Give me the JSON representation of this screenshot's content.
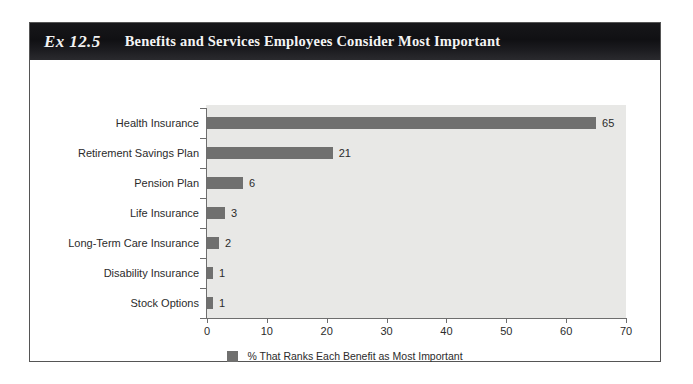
{
  "exhibit": {
    "number": "Ex 12.5",
    "title": "Benefits and Services Employees Consider Most Important"
  },
  "chart_data": {
    "type": "bar",
    "orientation": "horizontal",
    "title": "Benefits and Services Employees Consider Most Important",
    "categories": [
      "Health Insurance",
      "Retirement Savings Plan",
      "Pension Plan",
      "Life Insurance",
      "Long-Term Care Insurance",
      "Disability Insurance",
      "Stock Options"
    ],
    "values": [
      65,
      21,
      6,
      3,
      2,
      1,
      1
    ],
    "value_labels": [
      "65",
      "21",
      "6",
      "3",
      "2",
      "1",
      "1"
    ],
    "xlabel": "",
    "ylabel": "",
    "xlim": [
      0,
      70
    ],
    "xticks": [
      0,
      10,
      20,
      30,
      40,
      50,
      60,
      70
    ],
    "xtick_labels": [
      "0",
      "10",
      "20",
      "30",
      "40",
      "50",
      "60",
      "70"
    ],
    "grid": false,
    "legend": {
      "position": "bottom",
      "entries": [
        {
          "label": "% That Ranks Each Benefit as Most Important",
          "color": "#70706f"
        }
      ]
    },
    "series": [
      {
        "name": "% That Ranks Each Benefit as Most Important",
        "color": "#70706f",
        "values": [
          65,
          21,
          6,
          3,
          2,
          1,
          1
        ]
      }
    ],
    "colors": {
      "bar": "#70706f",
      "plot_background": "#e8e8e6",
      "axis": "#6e6e6e",
      "header_background": "#121215",
      "header_text": "#f2f2f2",
      "text": "#2b2b2b"
    }
  }
}
